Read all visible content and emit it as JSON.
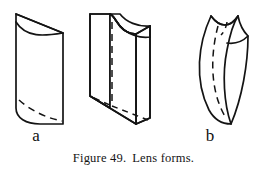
{
  "figure": {
    "caption_number": "Figure 49.",
    "caption_text": "Lens forms.",
    "panels": [
      {
        "id": "a",
        "label": "a",
        "name": "plano-convex-lens-blank",
        "description": "Upright block with one flat face and one convex curved face, shown in oblique projection with a hidden dashed bottom edge."
      },
      {
        "id": "b",
        "label": "b",
        "name": "concave-faced-lens-blank",
        "description": "Upright rectangular slab whose front face is concave, drawn in oblique projection with hidden dashed vertical and bottom edges."
      },
      {
        "id": "c",
        "label": "c",
        "name": "meniscus-lens-blank",
        "description": "Crescent or meniscus form curved on both faces, tapering to points at top and bottom, with a hidden dashed centre edge."
      }
    ]
  },
  "style": {
    "ink_color": "#141414",
    "paper_color": "#ffffff"
  }
}
